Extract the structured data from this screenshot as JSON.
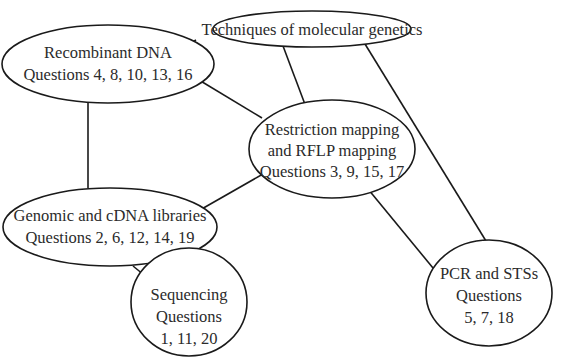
{
  "diagram": {
    "type": "concept-map",
    "nodes": [
      {
        "id": "root",
        "lines": [
          "Techniques of molecular genetics"
        ]
      },
      {
        "id": "recombinant",
        "lines": [
          "Recombinant DNA",
          "Questions 4, 8, 10, 13, 16"
        ]
      },
      {
        "id": "restriction",
        "lines": [
          "Restriction mapping",
          "and RFLP mapping",
          "Questions 3, 9, 15, 17"
        ]
      },
      {
        "id": "genomic",
        "lines": [
          "Genomic and cDNA libraries",
          "Questions 2, 6, 12, 14, 19"
        ]
      },
      {
        "id": "pcr",
        "lines": [
          "PCR and STSs",
          "Questions",
          "5, 7, 18"
        ]
      },
      {
        "id": "sequencing",
        "lines": [
          "Sequencing",
          "Questions",
          "1, 11, 20"
        ]
      }
    ],
    "edges": [
      [
        "root",
        "recombinant"
      ],
      [
        "root",
        "restriction"
      ],
      [
        "root",
        "pcr"
      ],
      [
        "recombinant",
        "restriction"
      ],
      [
        "recombinant",
        "genomic"
      ],
      [
        "restriction",
        "genomic"
      ],
      [
        "restriction",
        "pcr"
      ],
      [
        "genomic",
        "sequencing"
      ]
    ],
    "colors": {
      "stroke": "#1a1a1a",
      "text": "#2b2b2b",
      "background": "#ffffff"
    }
  }
}
